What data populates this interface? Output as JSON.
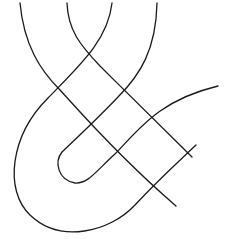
{
  "figure": {
    "stroke_color": "#1a1a1a",
    "background": "#ffffff",
    "curves": [
      {
        "name": "curve-a",
        "d": "M20,3 C24,45 40,70 60,90 C80,112 120,158 176,206"
      },
      {
        "name": "curve-b",
        "d": "M67,3 C68,30 80,45 100,66 C130,96 160,125 192,157"
      },
      {
        "name": "curve-c",
        "d": "M112,3 C108,40 80,65 48,98 C10,136 4,190 30,215 C60,244 110,232 135,205 C160,178 175,165 196,145"
      },
      {
        "name": "curve-d",
        "d": "M157,3 C156,50 140,75 118,97 C100,116 80,135 62,152 C54,162 58,180 75,183 C88,184 95,172 116,153 C140,128 160,100 218,86"
      }
    ]
  }
}
